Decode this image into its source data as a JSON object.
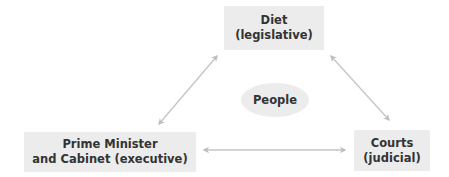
{
  "diagram": {
    "nodes": {
      "diet": {
        "line1": "Diet",
        "line2": "(legislative)"
      },
      "pm": {
        "line1": "Prime Minister",
        "line2": "and Cabinet (executive)"
      },
      "courts": {
        "line1": "Courts",
        "line2": "(judicial)"
      },
      "people": {
        "label": "People"
      }
    },
    "edges": [
      {
        "from": "diet",
        "to": "pm",
        "type": "bidirectional"
      },
      {
        "from": "diet",
        "to": "courts",
        "type": "bidirectional"
      },
      {
        "from": "pm",
        "to": "courts",
        "type": "bidirectional"
      }
    ],
    "colors": {
      "box_fill": "#ececec",
      "text": "#333333",
      "arrow": "#bdbdbd"
    }
  }
}
